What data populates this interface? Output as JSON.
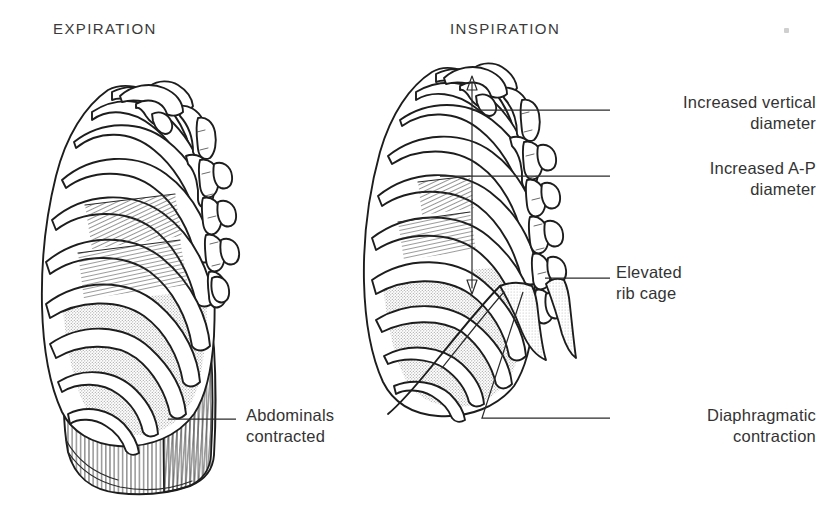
{
  "page": {
    "kind": "anatomical-illustration",
    "width": 821,
    "height": 515,
    "background": "#ffffff",
    "ink_color": "#1d1d1d",
    "text_color": "#333333",
    "shade_color": "#d8d8d8"
  },
  "figures": {
    "left": {
      "title": "EXPIRATION",
      "name": "expiration-figure"
    },
    "right": {
      "title": "INSPIRATION",
      "name": "inspiration-figure"
    }
  },
  "callouts": [
    {
      "id": "increased-vertical-diameter",
      "line1": "Increased vertical",
      "line2": "diameter",
      "align": "right",
      "figure": "inspiration"
    },
    {
      "id": "increased-ap-diameter",
      "line1": "Increased A-P",
      "line2": "diameter",
      "align": "right",
      "figure": "inspiration"
    },
    {
      "id": "elevated-rib-cage",
      "line1": "Elevated",
      "line2": "rib cage",
      "align": "left",
      "figure": "inspiration"
    },
    {
      "id": "diaphragmatic-contraction",
      "line1": "Diaphragmatic",
      "line2": "contraction",
      "align": "right",
      "figure": "inspiration"
    },
    {
      "id": "abdominals-contracted",
      "line1": "Abdominals",
      "line2": "contracted",
      "align": "left",
      "figure": "expiration"
    }
  ],
  "annotations": {
    "vertical_diameter_arrow": "double-headed vertical arrow inside inspiration rib cage",
    "intercostal_hatching": "diagonal line hatching between upper ribs",
    "abdominal_striations": "vertical line striations on abdominal muscle block",
    "intercostal_stipple": "stippled gray shading between lower ribs"
  }
}
